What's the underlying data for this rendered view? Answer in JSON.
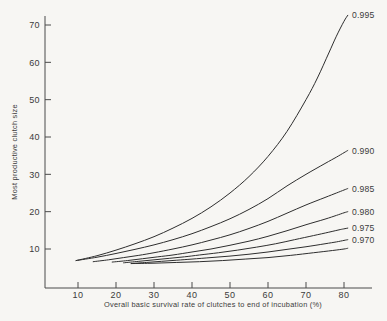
{
  "chart_data": {
    "type": "line",
    "title": "",
    "xlabel": "Overall basic survival rate of clutches  to end of incubation (%)",
    "ylabel": "Most productive clutch size",
    "xlim": [
      5,
      85
    ],
    "ylim": [
      0,
      75
    ],
    "xticks": [
      10,
      20,
      30,
      40,
      50,
      60,
      70,
      80
    ],
    "yticks": [
      10,
      20,
      30,
      40,
      50,
      60,
      70
    ],
    "xtick_labels": [
      "10",
      "20",
      "30",
      "40",
      "50",
      "60",
      "70",
      "80"
    ],
    "ytick_labels": [
      "10",
      "20",
      "30",
      "40",
      "50",
      "60",
      "70"
    ],
    "grid": false,
    "legend_position": "right-inline-curve-labels",
    "series": [
      {
        "name": "0.995",
        "label": "0.995",
        "x": [
          9.5,
          15,
          20,
          25,
          30,
          35,
          40,
          45,
          50,
          55,
          60,
          65,
          70,
          73,
          76,
          78,
          80,
          81
        ],
        "y": [
          6.9,
          8.2,
          9.7,
          11.4,
          13.3,
          15.6,
          18.2,
          21.3,
          25.0,
          29.4,
          34.8,
          41.5,
          50.0,
          55.8,
          62.5,
          67.0,
          71.0,
          72.6
        ]
      },
      {
        "name": "0.990",
        "label": "0.990",
        "x": [
          9.5,
          15,
          20,
          25,
          30,
          35,
          40,
          45,
          50,
          55,
          60,
          65,
          70,
          75,
          78,
          80,
          81
        ],
        "y": [
          6.9,
          7.8,
          8.8,
          9.9,
          11.1,
          12.5,
          14.1,
          16.0,
          18.1,
          20.6,
          23.5,
          26.9,
          30.0,
          32.9,
          34.6,
          35.8,
          36.4
        ]
      },
      {
        "name": "0.985",
        "label": "0.985",
        "x": [
          14,
          18,
          22,
          26,
          30,
          35,
          40,
          45,
          50,
          55,
          60,
          65,
          70,
          75,
          78,
          80,
          81
        ],
        "y": [
          6.6,
          7.1,
          7.7,
          8.3,
          9.0,
          10.0,
          11.1,
          12.4,
          13.8,
          15.5,
          17.4,
          19.6,
          21.8,
          23.8,
          25.0,
          25.8,
          26.2
        ]
      },
      {
        "name": "0.980",
        "label": "0.980",
        "x": [
          19,
          23,
          27,
          31,
          35,
          40,
          45,
          50,
          55,
          60,
          65,
          70,
          75,
          78,
          80,
          81
        ],
        "y": [
          6.5,
          6.9,
          7.4,
          7.9,
          8.4,
          9.2,
          10.0,
          11.0,
          12.1,
          13.4,
          14.9,
          16.5,
          18.0,
          19.0,
          19.7,
          20.0
        ]
      },
      {
        "name": "0.975",
        "label": "0.975",
        "x": [
          22,
          26,
          30,
          34,
          38,
          42,
          47,
          52,
          57,
          62,
          67,
          72,
          76,
          79,
          80,
          81
        ],
        "y": [
          6.3,
          6.7,
          7.1,
          7.5,
          7.9,
          8.4,
          9.0,
          9.7,
          10.5,
          11.4,
          12.5,
          13.6,
          14.5,
          15.2,
          15.4,
          15.6
        ]
      },
      {
        "name": "0.970",
        "label": "0.970",
        "x": [
          24,
          28,
          32,
          36,
          40,
          45,
          50,
          55,
          60,
          65,
          70,
          75,
          78,
          80,
          81
        ],
        "y": [
          6.1,
          6.4,
          6.7,
          7.0,
          7.3,
          7.7,
          8.1,
          8.6,
          9.2,
          9.9,
          10.6,
          11.4,
          11.9,
          12.3,
          12.5
        ]
      },
      {
        "name": "0.970-lower",
        "label": "",
        "x": [
          24,
          30,
          36,
          42,
          48,
          54,
          60,
          66,
          72,
          77,
          80,
          81
        ],
        "y": [
          6.1,
          6.2,
          6.4,
          6.6,
          6.9,
          7.3,
          7.7,
          8.3,
          9.0,
          9.6,
          10.0,
          10.2
        ]
      }
    ]
  },
  "labels": {
    "top_partial_title": ""
  }
}
